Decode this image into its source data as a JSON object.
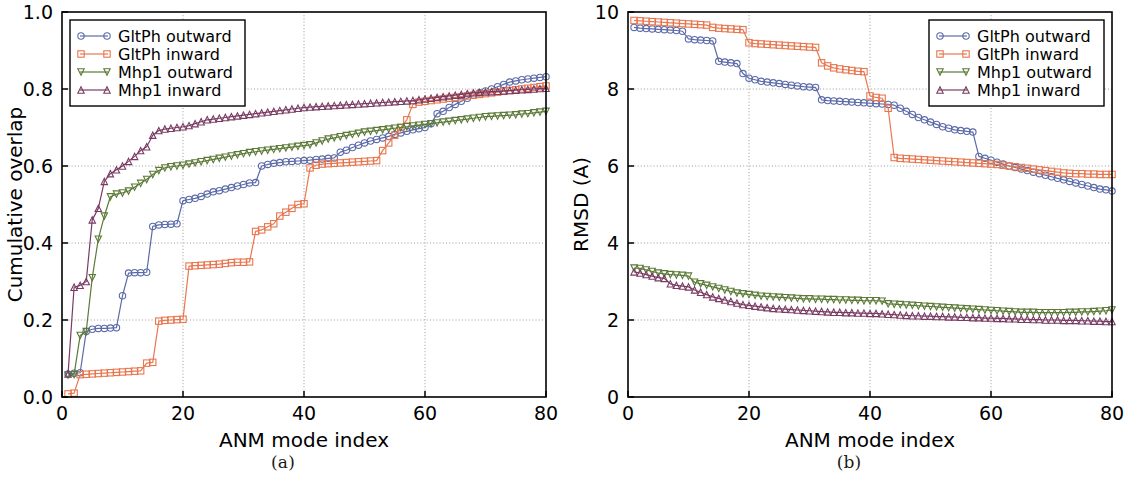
{
  "figure": {
    "panels": [
      {
        "caption": "(a)"
      },
      {
        "caption": "(b)"
      }
    ]
  },
  "colors": {
    "gltph_outward": "#5b6aa8",
    "gltph_inward": "#e8764f",
    "mhp1_outward": "#5b7a37",
    "mhp1_inward": "#7a3b63",
    "axis": "#000000",
    "grid": "#9a9a9a",
    "background": "#ffffff"
  },
  "legend": {
    "position": "upper-left-panel-a, upper-right-panel-b",
    "entries": [
      {
        "label": "GltPh outward",
        "marker": "circle",
        "color": "#5b6aa8"
      },
      {
        "label": "GltPh inward",
        "marker": "square",
        "color": "#e8764f"
      },
      {
        "label": "Mhp1 outward",
        "marker": "triangle-down",
        "color": "#5b7a37"
      },
      {
        "label": "Mhp1 inward",
        "marker": "triangle-up",
        "color": "#7a3b63"
      }
    ]
  },
  "chart_data": [
    {
      "panel": "(a)",
      "type": "line",
      "title": "",
      "xlabel": "ANM mode index",
      "ylabel": "Cumulative overlap",
      "xlim": [
        0,
        80
      ],
      "ylim": [
        0.0,
        1.0
      ],
      "xticks": [
        0,
        20,
        40,
        60,
        80
      ],
      "yticks": [
        0.0,
        0.2,
        0.4,
        0.6,
        0.8,
        1.0
      ],
      "ytick_labels": [
        "0.0",
        "0.2",
        "0.4",
        "0.6",
        "0.8",
        "1.0"
      ],
      "xtick_labels": [
        "0",
        "20",
        "40",
        "60",
        "80"
      ],
      "grid": true,
      "x": [
        1,
        2,
        3,
        4,
        5,
        6,
        7,
        8,
        9,
        10,
        11,
        12,
        13,
        14,
        15,
        16,
        17,
        18,
        19,
        20,
        21,
        22,
        23,
        24,
        25,
        26,
        27,
        28,
        29,
        30,
        31,
        32,
        33,
        34,
        35,
        36,
        37,
        38,
        39,
        40,
        41,
        42,
        43,
        44,
        45,
        46,
        47,
        48,
        49,
        50,
        51,
        52,
        53,
        54,
        55,
        56,
        57,
        58,
        59,
        60,
        61,
        62,
        63,
        64,
        65,
        66,
        67,
        68,
        69,
        70,
        71,
        72,
        73,
        74,
        75,
        76,
        77,
        78,
        79,
        80
      ],
      "series": [
        {
          "name": "GltPh outward",
          "marker": "circle",
          "color": "#5b6aa8",
          "values": [
            0.06,
            0.062,
            0.063,
            0.17,
            0.176,
            0.178,
            0.178,
            0.179,
            0.18,
            0.263,
            0.322,
            0.323,
            0.323,
            0.324,
            0.443,
            0.447,
            0.448,
            0.449,
            0.45,
            0.51,
            0.513,
            0.516,
            0.521,
            0.527,
            0.533,
            0.536,
            0.54,
            0.544,
            0.548,
            0.552,
            0.556,
            0.557,
            0.6,
            0.604,
            0.607,
            0.609,
            0.611,
            0.612,
            0.613,
            0.614,
            0.615,
            0.617,
            0.618,
            0.62,
            0.621,
            0.636,
            0.641,
            0.648,
            0.654,
            0.66,
            0.665,
            0.669,
            0.673,
            0.677,
            0.682,
            0.686,
            0.69,
            0.694,
            0.697,
            0.7,
            0.71,
            0.736,
            0.742,
            0.752,
            0.76,
            0.768,
            0.776,
            0.784,
            0.79,
            0.795,
            0.8,
            0.806,
            0.812,
            0.818,
            0.821,
            0.824,
            0.826,
            0.828,
            0.83,
            0.832
          ]
        },
        {
          "name": "GltPh inward",
          "marker": "square",
          "color": "#e8764f",
          "values": [
            0.008,
            0.01,
            0.058,
            0.059,
            0.06,
            0.061,
            0.062,
            0.063,
            0.064,
            0.065,
            0.066,
            0.067,
            0.068,
            0.088,
            0.09,
            0.197,
            0.199,
            0.2,
            0.201,
            0.202,
            0.34,
            0.341,
            0.342,
            0.343,
            0.344,
            0.345,
            0.347,
            0.349,
            0.35,
            0.35,
            0.351,
            0.43,
            0.434,
            0.442,
            0.45,
            0.47,
            0.48,
            0.49,
            0.5,
            0.502,
            0.595,
            0.602,
            0.605,
            0.606,
            0.607,
            0.608,
            0.609,
            0.61,
            0.611,
            0.612,
            0.613,
            0.614,
            0.64,
            0.66,
            0.68,
            0.7,
            0.72,
            0.76,
            0.766,
            0.768,
            0.77,
            0.772,
            0.774,
            0.776,
            0.778,
            0.78,
            0.782,
            0.784,
            0.786,
            0.788,
            0.79,
            0.792,
            0.794,
            0.796,
            0.798,
            0.8,
            0.802,
            0.804,
            0.806,
            0.808
          ]
        },
        {
          "name": "Mhp1 outward",
          "marker": "triangle-down",
          "color": "#5b7a37",
          "values": [
            0.057,
            0.058,
            0.16,
            0.17,
            0.31,
            0.41,
            0.47,
            0.52,
            0.527,
            0.53,
            0.535,
            0.545,
            0.555,
            0.565,
            0.578,
            0.588,
            0.595,
            0.598,
            0.6,
            0.602,
            0.605,
            0.608,
            0.611,
            0.614,
            0.617,
            0.62,
            0.623,
            0.626,
            0.629,
            0.632,
            0.635,
            0.637,
            0.639,
            0.641,
            0.643,
            0.645,
            0.647,
            0.649,
            0.651,
            0.653,
            0.655,
            0.66,
            0.665,
            0.67,
            0.673,
            0.676,
            0.679,
            0.682,
            0.685,
            0.688,
            0.69,
            0.692,
            0.694,
            0.696,
            0.698,
            0.7,
            0.702,
            0.704,
            0.706,
            0.708,
            0.71,
            0.712,
            0.714,
            0.716,
            0.718,
            0.72,
            0.722,
            0.724,
            0.726,
            0.728,
            0.729,
            0.73,
            0.731,
            0.732,
            0.733,
            0.735,
            0.736,
            0.738,
            0.74,
            0.742
          ]
        },
        {
          "name": "Mhp1 inward",
          "marker": "triangle-up",
          "color": "#7a3b63",
          "values": [
            0.06,
            0.285,
            0.29,
            0.3,
            0.46,
            0.49,
            0.56,
            0.58,
            0.59,
            0.6,
            0.612,
            0.625,
            0.64,
            0.65,
            0.68,
            0.692,
            0.696,
            0.698,
            0.7,
            0.702,
            0.705,
            0.71,
            0.715,
            0.72,
            0.722,
            0.724,
            0.726,
            0.728,
            0.73,
            0.732,
            0.734,
            0.736,
            0.738,
            0.74,
            0.742,
            0.744,
            0.746,
            0.748,
            0.75,
            0.752,
            0.753,
            0.754,
            0.755,
            0.756,
            0.757,
            0.758,
            0.759,
            0.76,
            0.761,
            0.762,
            0.763,
            0.764,
            0.765,
            0.766,
            0.767,
            0.768,
            0.769,
            0.77,
            0.772,
            0.774,
            0.776,
            0.778,
            0.78,
            0.782,
            0.784,
            0.786,
            0.788,
            0.79,
            0.791,
            0.792,
            0.793,
            0.794,
            0.795,
            0.796,
            0.797,
            0.798,
            0.799,
            0.8,
            0.801,
            0.802
          ]
        }
      ]
    },
    {
      "panel": "(b)",
      "type": "line",
      "title": "",
      "xlabel": "ANM mode index",
      "ylabel": "RMSD (A)",
      "xlim": [
        0,
        80
      ],
      "ylim": [
        0,
        10
      ],
      "xticks": [
        0,
        20,
        40,
        60,
        80
      ],
      "yticks": [
        0,
        2,
        4,
        6,
        8,
        10
      ],
      "ytick_labels": [
        "0",
        "2",
        "4",
        "6",
        "8",
        "10"
      ],
      "xtick_labels": [
        "0",
        "20",
        "40",
        "60",
        "80"
      ],
      "grid": true,
      "x": [
        1,
        2,
        3,
        4,
        5,
        6,
        7,
        8,
        9,
        10,
        11,
        12,
        13,
        14,
        15,
        16,
        17,
        18,
        19,
        20,
        21,
        22,
        23,
        24,
        25,
        26,
        27,
        28,
        29,
        30,
        31,
        32,
        33,
        34,
        35,
        36,
        37,
        38,
        39,
        40,
        41,
        42,
        43,
        44,
        45,
        46,
        47,
        48,
        49,
        50,
        51,
        52,
        53,
        54,
        55,
        56,
        57,
        58,
        59,
        60,
        61,
        62,
        63,
        64,
        65,
        66,
        67,
        68,
        69,
        70,
        71,
        72,
        73,
        74,
        75,
        76,
        77,
        78,
        79,
        80
      ],
      "series": [
        {
          "name": "GltPh outward",
          "marker": "circle",
          "color": "#5b6aa8",
          "values": [
            9.6,
            9.58,
            9.57,
            9.56,
            9.55,
            9.54,
            9.53,
            9.52,
            9.5,
            9.3,
            9.28,
            9.27,
            9.26,
            9.25,
            8.72,
            8.7,
            8.68,
            8.66,
            8.4,
            8.28,
            8.24,
            8.2,
            8.18,
            8.16,
            8.14,
            8.12,
            8.1,
            8.08,
            8.06,
            8.05,
            8.04,
            7.72,
            7.7,
            7.69,
            7.68,
            7.67,
            7.66,
            7.65,
            7.64,
            7.63,
            7.62,
            7.61,
            7.6,
            7.58,
            7.5,
            7.42,
            7.34,
            7.26,
            7.2,
            7.14,
            7.08,
            7.02,
            6.98,
            6.94,
            6.92,
            6.9,
            6.88,
            6.25,
            6.2,
            6.15,
            6.1,
            6.05,
            6.0,
            5.96,
            5.92,
            5.88,
            5.84,
            5.8,
            5.76,
            5.72,
            5.68,
            5.64,
            5.6,
            5.56,
            5.52,
            5.48,
            5.44,
            5.4,
            5.38,
            5.35
          ]
        },
        {
          "name": "GltPh inward",
          "marker": "square",
          "color": "#e8764f",
          "values": [
            9.78,
            9.77,
            9.76,
            9.75,
            9.74,
            9.73,
            9.72,
            9.71,
            9.7,
            9.69,
            9.68,
            9.67,
            9.66,
            9.6,
            9.58,
            9.57,
            9.56,
            9.55,
            9.54,
            9.2,
            9.18,
            9.17,
            9.16,
            9.15,
            9.14,
            9.13,
            9.12,
            9.11,
            9.1,
            9.09,
            9.08,
            8.68,
            8.6,
            8.55,
            8.52,
            8.5,
            8.48,
            8.46,
            8.45,
            7.82,
            7.78,
            7.76,
            7.5,
            6.22,
            6.2,
            6.19,
            6.18,
            6.17,
            6.16,
            6.15,
            6.14,
            6.13,
            6.12,
            6.11,
            6.1,
            6.09,
            6.08,
            6.07,
            6.06,
            6.05,
            6.04,
            6.02,
            6.0,
            5.98,
            5.96,
            5.94,
            5.92,
            5.9,
            5.88,
            5.86,
            5.84,
            5.82,
            5.81,
            5.8,
            5.8,
            5.79,
            5.79,
            5.78,
            5.78,
            5.78
          ]
        },
        {
          "name": "Mhp1 outward",
          "marker": "triangle-down",
          "color": "#5b7a37",
          "values": [
            3.35,
            3.34,
            3.3,
            3.26,
            3.22,
            3.2,
            3.18,
            3.17,
            3.16,
            3.14,
            2.98,
            2.94,
            2.9,
            2.86,
            2.82,
            2.78,
            2.74,
            2.7,
            2.68,
            2.66,
            2.64,
            2.62,
            2.61,
            2.6,
            2.59,
            2.58,
            2.57,
            2.56,
            2.55,
            2.55,
            2.54,
            2.54,
            2.53,
            2.53,
            2.52,
            2.52,
            2.51,
            2.51,
            2.5,
            2.5,
            2.5,
            2.49,
            2.42,
            2.41,
            2.4,
            2.39,
            2.38,
            2.37,
            2.36,
            2.35,
            2.34,
            2.33,
            2.32,
            2.31,
            2.3,
            2.29,
            2.28,
            2.27,
            2.26,
            2.25,
            2.24,
            2.23,
            2.22,
            2.21,
            2.2,
            2.2,
            2.2,
            2.19,
            2.19,
            2.19,
            2.19,
            2.19,
            2.2,
            2.2,
            2.21,
            2.21,
            2.22,
            2.23,
            2.24,
            2.26
          ]
        },
        {
          "name": "Mhp1 inward",
          "marker": "triangle-up",
          "color": "#7a3b63",
          "values": [
            3.25,
            3.22,
            3.18,
            3.14,
            3.1,
            3.08,
            2.94,
            2.9,
            2.88,
            2.86,
            2.78,
            2.72,
            2.66,
            2.6,
            2.56,
            2.52,
            2.48,
            2.44,
            2.4,
            2.38,
            2.36,
            2.34,
            2.32,
            2.3,
            2.29,
            2.28,
            2.27,
            2.26,
            2.25,
            2.24,
            2.23,
            2.22,
            2.21,
            2.2,
            2.2,
            2.19,
            2.19,
            2.18,
            2.18,
            2.17,
            2.17,
            2.16,
            2.15,
            2.14,
            2.13,
            2.12,
            2.11,
            2.11,
            2.1,
            2.1,
            2.09,
            2.09,
            2.08,
            2.08,
            2.07,
            2.07,
            2.06,
            2.06,
            2.05,
            2.05,
            2.04,
            2.04,
            2.03,
            2.03,
            2.02,
            2.02,
            2.01,
            2.01,
            2.0,
            2.0,
            2.0,
            1.99,
            1.99,
            1.99,
            1.98,
            1.98,
            1.97,
            1.97,
            1.96,
            1.96
          ]
        }
      ]
    }
  ]
}
